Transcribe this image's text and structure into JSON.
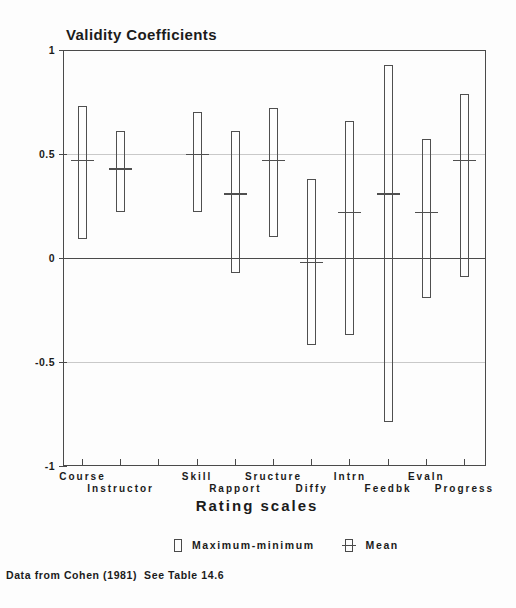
{
  "caption": "Data from Cohen (1981)  See Table 14.6",
  "colors": {
    "background": "#fdfdfd",
    "text": "#1b1b1b",
    "axis": "#4a4a4a",
    "bar_outline": "#4f4f4f",
    "gridline": "#c9c9c9"
  },
  "chart_data": {
    "type": "range-bar",
    "title": "Validity Coefficients",
    "xlabel": "Rating scales",
    "ylim": [
      -1,
      1
    ],
    "yticks": [
      "1",
      "0.5",
      "0",
      "-0.5",
      "-1"
    ],
    "ytick_values": [
      1,
      0.5,
      0,
      -0.5,
      -1
    ],
    "gridlines": [
      0.5,
      -0.5
    ],
    "zero_line": 0,
    "x_slots": 11,
    "grid": "horizontal-only",
    "legend_position": "bottom",
    "legend": [
      "Maximum-minimum",
      "Mean"
    ],
    "series": [
      {
        "label": "Course",
        "slot": 0,
        "label_row": 1,
        "min": 0.09,
        "max": 0.73,
        "mean": 0.47
      },
      {
        "label": "Instructor",
        "slot": 1,
        "label_row": 2,
        "min": 0.22,
        "max": 0.61,
        "mean": 0.43
      },
      {
        "label": "Skill",
        "slot": 3,
        "label_row": 1,
        "min": 0.22,
        "max": 0.7,
        "mean": 0.5
      },
      {
        "label": "Rapport",
        "slot": 4,
        "label_row": 2,
        "min": -0.07,
        "max": 0.61,
        "mean": 0.31
      },
      {
        "label": "Sructure",
        "slot": 5,
        "label_row": 1,
        "min": 0.1,
        "max": 0.72,
        "mean": 0.47
      },
      {
        "label": "Diffy",
        "slot": 6,
        "label_row": 2,
        "min": -0.42,
        "max": 0.38,
        "mean": -0.02
      },
      {
        "label": "Intrn",
        "slot": 7,
        "label_row": 1,
        "min": -0.37,
        "max": 0.66,
        "mean": 0.22
      },
      {
        "label": "Feedbk",
        "slot": 8,
        "label_row": 2,
        "min": -0.79,
        "max": 0.93,
        "mean": 0.31
      },
      {
        "label": "Evaln",
        "slot": 9,
        "label_row": 1,
        "min": -0.19,
        "max": 0.57,
        "mean": 0.22
      },
      {
        "label": "Progress",
        "slot": 10,
        "label_row": 2,
        "min": -0.09,
        "max": 0.79,
        "mean": 0.47
      }
    ]
  }
}
